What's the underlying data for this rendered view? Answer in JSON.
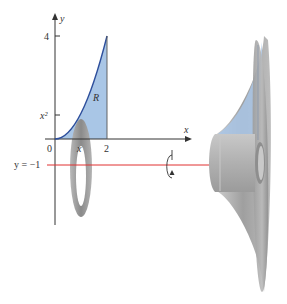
{
  "figure": {
    "type": "solid-of-revolution"
  },
  "axes": {
    "x_label": "x",
    "y_label": "y",
    "origin_label": "0",
    "x_tick_label": "2",
    "y_tick_label": "4",
    "x_sample_label": "x",
    "y_sample_label": "x²"
  },
  "region": {
    "label": "R",
    "fill_color": "#a9c6e6",
    "curve_color": "#2e4f9c"
  },
  "axis_of_rotation": {
    "label": "y = −1",
    "color": "#e03030"
  },
  "washer": {
    "color": "#8f8f8f"
  },
  "solid": {
    "color": "#a6a6a6"
  },
  "rotation_icon": "rotation-arrow-icon"
}
